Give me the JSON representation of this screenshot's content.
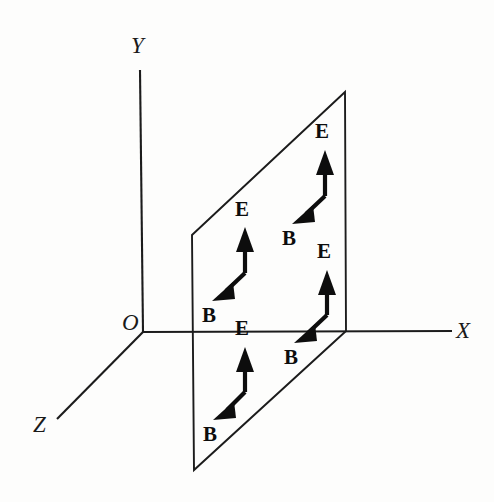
{
  "figure": {
    "kind": "physics-vector-diagram",
    "background_color": "#fdfdfc",
    "ink_color": "#0d0d0d",
    "canvas": {
      "width": 494,
      "height": 502
    }
  },
  "axes": {
    "origin_label": "O",
    "origin_point": {
      "x": 143,
      "y": 332
    },
    "items": [
      {
        "name": "y-axis",
        "label": "Y",
        "label_pos": {
          "x": 131,
          "y": 53
        },
        "from": {
          "x": 143,
          "y": 332
        },
        "to": {
          "x": 140,
          "y": 70
        }
      },
      {
        "name": "x-axis",
        "label": "X",
        "label_pos": {
          "x": 456,
          "y": 338
        },
        "from": {
          "x": 143,
          "y": 332
        },
        "to": {
          "x": 452,
          "y": 331
        }
      },
      {
        "name": "z-axis",
        "label": "Z",
        "label_pos": {
          "x": 33,
          "y": 432
        },
        "from": {
          "x": 143,
          "y": 332
        },
        "to": {
          "x": 57,
          "y": 419
        }
      }
    ]
  },
  "plane": {
    "name": "xy-wavefront-plane",
    "corners": [
      {
        "x": 192,
        "y": 235
      },
      {
        "x": 345,
        "y": 92
      },
      {
        "x": 346,
        "y": 331
      },
      {
        "x": 194,
        "y": 470
      }
    ]
  },
  "field_pairs": [
    {
      "id": "pair-upper-right",
      "vertex": {
        "x": 325,
        "y": 196
      },
      "e": {
        "label": "E",
        "label_pos": {
          "x": 315,
          "y": 138
        },
        "tip": {
          "x": 325,
          "y": 152
        }
      },
      "b": {
        "label": "B",
        "label_pos": {
          "x": 282,
          "y": 245
        },
        "tip": {
          "x": 294,
          "y": 222
        }
      }
    },
    {
      "id": "pair-middle-left",
      "vertex": {
        "x": 245,
        "y": 273
      },
      "e": {
        "label": "E",
        "label_pos": {
          "x": 235,
          "y": 216
        },
        "tip": {
          "x": 245,
          "y": 229
        }
      },
      "b": {
        "label": "B",
        "label_pos": {
          "x": 202,
          "y": 322
        },
        "tip": {
          "x": 214,
          "y": 299
        }
      }
    },
    {
      "id": "pair-lower-right",
      "vertex": {
        "x": 327,
        "y": 315
      },
      "e": {
        "label": "E",
        "label_pos": {
          "x": 317,
          "y": 258
        },
        "tip": {
          "x": 327,
          "y": 272
        }
      },
      "b": {
        "label": "B",
        "label_pos": {
          "x": 284,
          "y": 364
        },
        "tip": {
          "x": 296,
          "y": 341
        }
      }
    },
    {
      "id": "pair-lower-left",
      "vertex": {
        "x": 245,
        "y": 392
      },
      "e": {
        "label": "E",
        "label_pos": {
          "x": 235,
          "y": 335
        },
        "tip": {
          "x": 245,
          "y": 349
        }
      },
      "b": {
        "label": "B",
        "label_pos": {
          "x": 203,
          "y": 441
        },
        "tip": {
          "x": 215,
          "y": 418
        }
      }
    }
  ]
}
